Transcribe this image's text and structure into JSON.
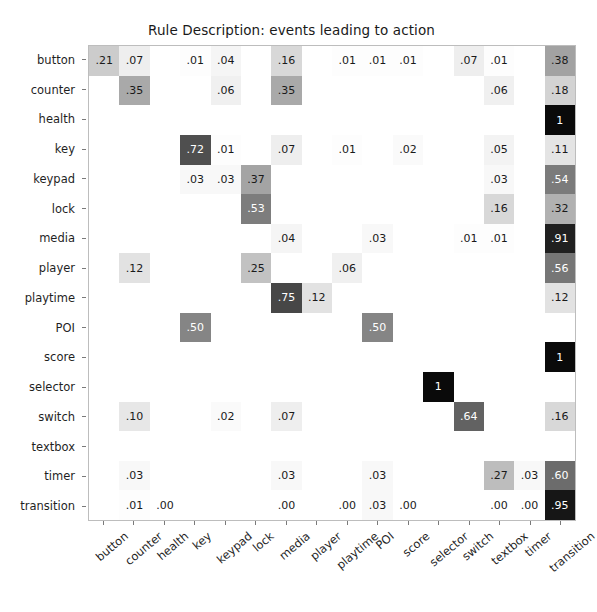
{
  "chart_data": {
    "type": "heatmap",
    "title": "Rule Description: events leading to action",
    "xlabel": "",
    "ylabel": "",
    "grid": false,
    "legend": "none",
    "colormap": "greys",
    "value_range": [
      0,
      1
    ],
    "categories": [
      "button",
      "counter",
      "health",
      "key",
      "keypad",
      "lock",
      "media",
      "player",
      "playtime",
      "POI",
      "score",
      "selector",
      "switch",
      "textbox",
      "timer",
      "transition"
    ],
    "row_labels": [
      "button",
      "counter",
      "health",
      "key",
      "keypad",
      "lock",
      "media",
      "player",
      "playtime",
      "POI",
      "score",
      "selector",
      "switch",
      "textbox",
      "timer",
      "transition"
    ],
    "column_labels": [
      "button",
      "counter",
      "health",
      "key",
      "keypad",
      "lock",
      "media",
      "player",
      "playtime",
      "POI",
      "score",
      "selector",
      "switch",
      "textbox",
      "timer",
      "transition"
    ],
    "cell_text": [
      [
        ".21",
        ".07",
        "",
        ".01",
        ".04",
        "",
        ".16",
        "",
        ".01",
        ".01",
        ".01",
        "",
        ".07",
        ".01",
        "",
        ".38"
      ],
      [
        "",
        ".35",
        "",
        "",
        ".06",
        "",
        ".35",
        "",
        "",
        "",
        "",
        "",
        "",
        ".06",
        "",
        ".18"
      ],
      [
        "",
        "",
        "",
        "",
        "",
        "",
        "",
        "",
        "",
        "",
        "",
        "",
        "",
        "",
        "",
        "1"
      ],
      [
        "",
        "",
        "",
        ".72",
        ".01",
        "",
        ".07",
        "",
        ".01",
        "",
        ".02",
        "",
        "",
        ".05",
        "",
        ".11"
      ],
      [
        "",
        "",
        "",
        ".03",
        ".03",
        ".37",
        "",
        "",
        "",
        "",
        "",
        "",
        "",
        ".03",
        "",
        ".54"
      ],
      [
        "",
        "",
        "",
        "",
        "",
        ".53",
        "",
        "",
        "",
        "",
        "",
        "",
        "",
        ".16",
        "",
        ".32"
      ],
      [
        "",
        "",
        "",
        "",
        "",
        "",
        ".04",
        "",
        "",
        ".03",
        "",
        "",
        ".01",
        ".01",
        "",
        ".91"
      ],
      [
        "",
        ".12",
        "",
        "",
        "",
        ".25",
        "",
        "",
        ".06",
        "",
        "",
        "",
        "",
        "",
        "",
        ".56"
      ],
      [
        "",
        "",
        "",
        "",
        "",
        "",
        ".75",
        ".12",
        "",
        "",
        "",
        "",
        "",
        "",
        "",
        ".12"
      ],
      [
        "",
        "",
        "",
        ".50",
        "",
        "",
        "",
        "",
        "",
        ".50",
        "",
        "",
        "",
        "",
        "",
        ""
      ],
      [
        "",
        "",
        "",
        "",
        "",
        "",
        "",
        "",
        "",
        "",
        "",
        "",
        "",
        "",
        "",
        "1"
      ],
      [
        "",
        "",
        "",
        "",
        "",
        "",
        "",
        "",
        "",
        "",
        "",
        "1",
        "",
        "",
        "",
        ""
      ],
      [
        "",
        ".10",
        "",
        "",
        ".02",
        "",
        ".07",
        "",
        "",
        "",
        "",
        "",
        ".64",
        "",
        "",
        ".16"
      ],
      [
        "",
        "",
        "",
        "",
        "",
        "",
        "",
        "",
        "",
        "",
        "",
        "",
        "",
        "",
        "",
        ""
      ],
      [
        "",
        ".03",
        "",
        "",
        "",
        "",
        ".03",
        "",
        "",
        ".03",
        "",
        "",
        "",
        ".27",
        ".03",
        ".60"
      ],
      [
        "",
        ".01",
        ".00",
        "",
        "",
        "",
        ".00",
        "",
        ".00",
        ".03",
        ".00",
        "",
        "",
        ".00",
        ".00",
        ".95"
      ]
    ],
    "values": [
      [
        0.21,
        0.07,
        null,
        0.01,
        0.04,
        null,
        0.16,
        null,
        0.01,
        0.01,
        0.01,
        null,
        0.07,
        0.01,
        null,
        0.38
      ],
      [
        null,
        0.35,
        null,
        null,
        0.06,
        null,
        0.35,
        null,
        null,
        null,
        null,
        null,
        null,
        0.06,
        null,
        0.18
      ],
      [
        null,
        null,
        null,
        null,
        null,
        null,
        null,
        null,
        null,
        null,
        null,
        null,
        null,
        null,
        null,
        1
      ],
      [
        null,
        null,
        null,
        0.72,
        0.01,
        null,
        0.07,
        null,
        0.01,
        null,
        0.02,
        null,
        null,
        0.05,
        null,
        0.11
      ],
      [
        null,
        null,
        null,
        0.03,
        0.03,
        0.37,
        null,
        null,
        null,
        null,
        null,
        null,
        null,
        0.03,
        null,
        0.54
      ],
      [
        null,
        null,
        null,
        null,
        null,
        0.53,
        null,
        null,
        null,
        null,
        null,
        null,
        null,
        0.16,
        null,
        0.32
      ],
      [
        null,
        null,
        null,
        null,
        null,
        null,
        0.04,
        null,
        null,
        0.03,
        null,
        null,
        0.01,
        0.01,
        null,
        0.91
      ],
      [
        null,
        0.12,
        null,
        null,
        null,
        0.25,
        null,
        null,
        0.06,
        null,
        null,
        null,
        null,
        null,
        null,
        0.56
      ],
      [
        null,
        null,
        null,
        null,
        null,
        null,
        0.75,
        0.12,
        null,
        null,
        null,
        null,
        null,
        null,
        null,
        0.12
      ],
      [
        null,
        null,
        null,
        0.5,
        null,
        null,
        null,
        null,
        null,
        0.5,
        null,
        null,
        null,
        null,
        null,
        null
      ],
      [
        null,
        null,
        null,
        null,
        null,
        null,
        null,
        null,
        null,
        null,
        null,
        null,
        null,
        null,
        null,
        1
      ],
      [
        null,
        null,
        null,
        null,
        null,
        null,
        null,
        null,
        null,
        null,
        null,
        1,
        null,
        null,
        null,
        null
      ],
      [
        null,
        0.1,
        null,
        null,
        0.02,
        null,
        0.07,
        null,
        null,
        null,
        null,
        null,
        0.64,
        null,
        null,
        0.16
      ],
      [
        null,
        null,
        null,
        null,
        null,
        null,
        null,
        null,
        null,
        null,
        null,
        null,
        null,
        null,
        null,
        null
      ],
      [
        null,
        0.03,
        null,
        null,
        null,
        null,
        0.03,
        null,
        null,
        0.03,
        null,
        null,
        null,
        0.27,
        0.03,
        0.6
      ],
      [
        null,
        0.01,
        0.0,
        null,
        null,
        null,
        0.0,
        null,
        0.0,
        0.03,
        0.0,
        null,
        null,
        0.0,
        0.0,
        0.95
      ]
    ]
  },
  "colors": {
    "background": "#ffffff",
    "axis": "#bdbdbd",
    "text_dark": "#1a1a1a",
    "text_light": "#ffffff"
  }
}
